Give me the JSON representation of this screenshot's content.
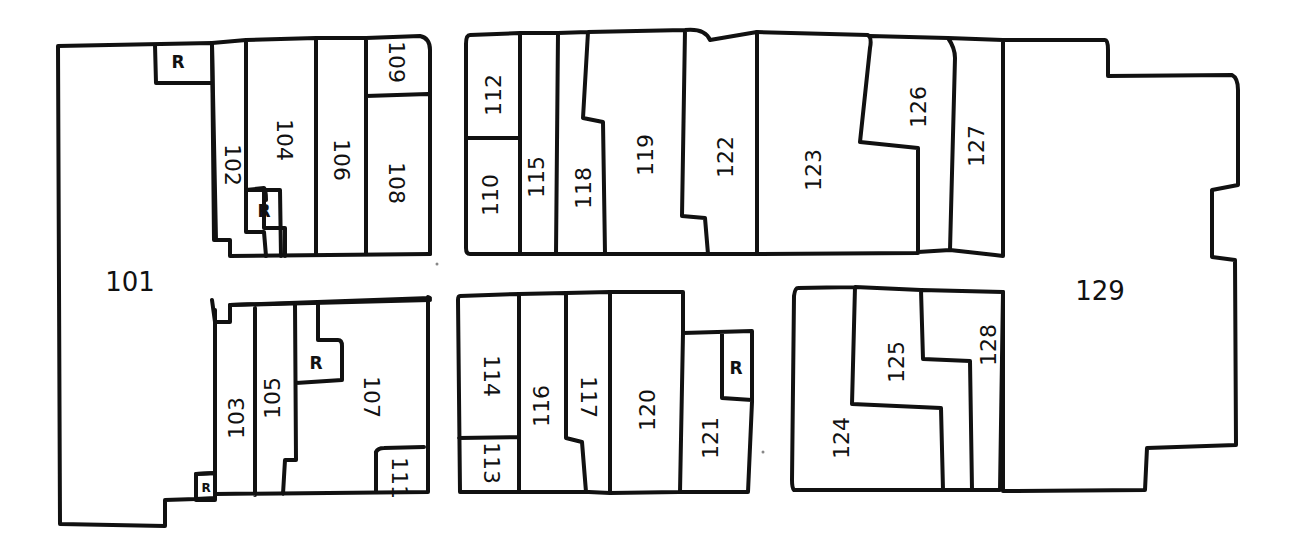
{
  "diagram": {
    "type": "floor-plan",
    "style": "hand-drawn",
    "colors": {
      "stroke": "#111111",
      "background": "#ffffff"
    },
    "rooms": [
      {
        "id": "101",
        "label": "101",
        "x": 130,
        "y": 283,
        "rotate": 0
      },
      {
        "id": "102",
        "label": "102",
        "x": 231,
        "y": 165,
        "rotate": 90
      },
      {
        "id": "103",
        "label": "103",
        "x": 238,
        "y": 418,
        "rotate": -90
      },
      {
        "id": "104",
        "label": "104",
        "x": 283,
        "y": 140,
        "rotate": 90
      },
      {
        "id": "105",
        "label": "105",
        "x": 274,
        "y": 398,
        "rotate": -90
      },
      {
        "id": "106",
        "label": "106",
        "x": 340,
        "y": 160,
        "rotate": 90
      },
      {
        "id": "107",
        "label": "107",
        "x": 370,
        "y": 397,
        "rotate": 90
      },
      {
        "id": "108",
        "label": "108",
        "x": 395,
        "y": 183,
        "rotate": 90
      },
      {
        "id": "109",
        "label": "109",
        "x": 395,
        "y": 62,
        "rotate": 90
      },
      {
        "id": "110",
        "label": "110",
        "x": 492,
        "y": 195,
        "rotate": -90
      },
      {
        "id": "111",
        "label": "111",
        "x": 398,
        "y": 478,
        "rotate": 90
      },
      {
        "id": "112",
        "label": "112",
        "x": 495,
        "y": 95,
        "rotate": -90
      },
      {
        "id": "113",
        "label": "113",
        "x": 490,
        "y": 463,
        "rotate": 90
      },
      {
        "id": "114",
        "label": "114",
        "x": 490,
        "y": 376,
        "rotate": 90
      },
      {
        "id": "115",
        "label": "115",
        "x": 538,
        "y": 177,
        "rotate": -90
      },
      {
        "id": "116",
        "label": "116",
        "x": 543,
        "y": 406,
        "rotate": -90
      },
      {
        "id": "117",
        "label": "117",
        "x": 587,
        "y": 397,
        "rotate": 90
      },
      {
        "id": "118",
        "label": "118",
        "x": 585,
        "y": 188,
        "rotate": -90
      },
      {
        "id": "119",
        "label": "119",
        "x": 647,
        "y": 155,
        "rotate": -90
      },
      {
        "id": "120",
        "label": "120",
        "x": 649,
        "y": 410,
        "rotate": -90
      },
      {
        "id": "121",
        "label": "121",
        "x": 712,
        "y": 438,
        "rotate": -90
      },
      {
        "id": "122",
        "label": "122",
        "x": 727,
        "y": 157,
        "rotate": -90
      },
      {
        "id": "123",
        "label": "123",
        "x": 815,
        "y": 170,
        "rotate": -90
      },
      {
        "id": "124",
        "label": "124",
        "x": 843,
        "y": 438,
        "rotate": -90
      },
      {
        "id": "125",
        "label": "125",
        "x": 898,
        "y": 362,
        "rotate": -90
      },
      {
        "id": "126",
        "label": "126",
        "x": 920,
        "y": 107,
        "rotate": -90
      },
      {
        "id": "127",
        "label": "127",
        "x": 978,
        "y": 146,
        "rotate": -90
      },
      {
        "id": "128",
        "label": "128",
        "x": 990,
        "y": 345,
        "rotate": -90
      },
      {
        "id": "129",
        "label": "129",
        "x": 1100,
        "y": 292,
        "rotate": 0
      }
    ],
    "restrooms": [
      {
        "label": "R",
        "x": 178,
        "y": 63
      },
      {
        "label": "R",
        "x": 264,
        "y": 212
      },
      {
        "label": "R",
        "x": 316,
        "y": 364
      },
      {
        "label": "R",
        "x": 736,
        "y": 369
      },
      {
        "label": "R",
        "x": 206,
        "y": 488,
        "small": true
      }
    ]
  }
}
